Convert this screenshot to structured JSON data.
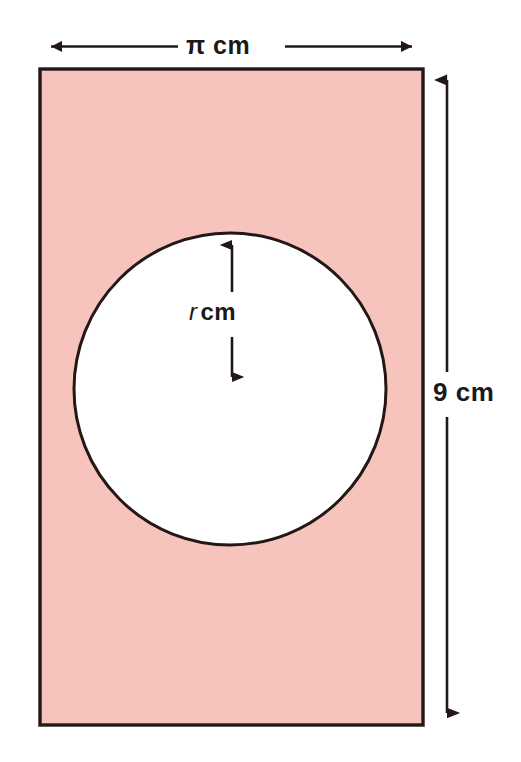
{
  "figure": {
    "type": "geometry-diagram",
    "shapes": {
      "rectangle": {
        "name": "shaded-rectangle",
        "fill_color": "#f6c3bd",
        "stroke_color": "#231815",
        "x": 40,
        "y": 69,
        "width": 383,
        "height": 656
      },
      "circle": {
        "name": "inner-circle",
        "fill_color": "#ffffff",
        "stroke_color": "#231815",
        "center_x": 230,
        "center_y": 389,
        "radius": 156
      }
    },
    "dimensions": [
      {
        "name": "width-dimension",
        "label_prefix": "π",
        "label_unit": "cm",
        "label": "π cm",
        "orientation": "horizontal",
        "position": "top"
      },
      {
        "name": "height-dimension",
        "label_prefix": "9",
        "label_unit": "cm",
        "label": "9 cm",
        "orientation": "vertical",
        "position": "right"
      },
      {
        "name": "radius-dimension",
        "label_prefix": "r",
        "label_unit": "cm",
        "label": "r cm",
        "orientation": "vertical",
        "position": "inside-circle"
      }
    ]
  }
}
